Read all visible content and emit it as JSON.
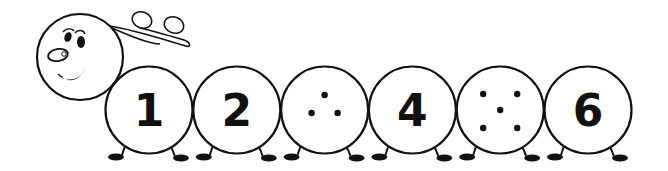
{
  "illustration": {
    "subject": "caterpillar counting sequence",
    "colors": {
      "stroke": "#111111",
      "background": "#ffffff"
    },
    "segments": [
      {
        "index": 1,
        "type": "numeral",
        "label": "1",
        "dots": 0
      },
      {
        "index": 2,
        "type": "numeral",
        "label": "2",
        "dots": 0
      },
      {
        "index": 3,
        "type": "dots",
        "label": "",
        "dots": 3
      },
      {
        "index": 4,
        "type": "numeral",
        "label": "4",
        "dots": 0
      },
      {
        "index": 5,
        "type": "dots",
        "label": "",
        "dots": 5
      },
      {
        "index": 6,
        "type": "numeral",
        "label": "6",
        "dots": 0
      }
    ]
  }
}
